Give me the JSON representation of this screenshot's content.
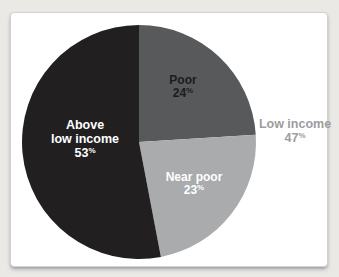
{
  "page": {
    "background_color": "#ebe9e6"
  },
  "card": {
    "background_color": "#ffffff",
    "border_color": "#d2d2d2"
  },
  "chart_data": {
    "type": "pie",
    "title": "",
    "start_angle_deg": 0,
    "direction": "clockwise",
    "legend_position": "none",
    "slices": [
      {
        "label": "Poor",
        "value": 24,
        "value_text": "24",
        "percent_sign": "%",
        "color": "#58595b",
        "label_color": "#1c1c1e"
      },
      {
        "label": "Near poor",
        "value": 23,
        "value_text": "23",
        "percent_sign": "%",
        "color": "#a9abad",
        "label_color": "#ffffff"
      },
      {
        "label": "Above low income",
        "label_line1": "Above",
        "label_line2": "low income",
        "value": 53,
        "value_text": "53",
        "percent_sign": "%",
        "color": "#221f20",
        "label_color": "#ffffff"
      }
    ],
    "callout": {
      "label": "Low income",
      "value": 47,
      "value_text": "47",
      "percent_sign": "%",
      "note": "sum of Poor and Near poor",
      "color": "#9b9da0"
    }
  }
}
